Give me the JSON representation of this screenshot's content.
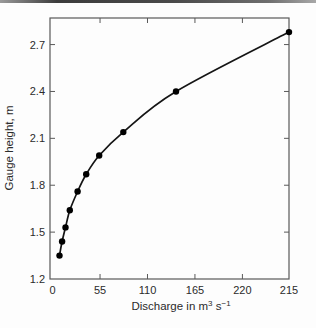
{
  "page": {
    "background": "#fdfdfd",
    "top_rule_color": "#4a4a4a"
  },
  "chart_data": {
    "type": "line",
    "title": "",
    "ylabel": "Gauge height, m",
    "xlabel_plain": "Discharge in m3 s−1",
    "xlabel_parts": [
      {
        "t": "Discharge in m",
        "sup": false
      },
      {
        "t": "3",
        "sup": true
      },
      {
        "t": " s",
        "sup": false
      },
      {
        "t": "−1",
        "sup": true
      }
    ],
    "xlim": [
      -3,
      274
    ],
    "ylim": [
      1.2,
      2.87
    ],
    "grid": false,
    "legend": null,
    "x_ticks": {
      "values": [
        0,
        55,
        110,
        165,
        220,
        274
      ],
      "labels": [
        "0",
        "55",
        "110",
        "165",
        "220",
        "215"
      ]
    },
    "y_ticks": {
      "values": [
        1.2,
        1.5,
        1.8,
        2.1,
        2.4,
        2.7
      ],
      "labels": [
        "1.2",
        "1.5",
        "1.8",
        "2.1",
        "2.4",
        "2.7"
      ]
    },
    "series": [
      {
        "name": "stage-discharge rating curve",
        "marker": "circle",
        "x": [
          8,
          11,
          15,
          20,
          29,
          39,
          54,
          82,
          143,
          274
        ],
        "y": [
          1.35,
          1.44,
          1.53,
          1.64,
          1.76,
          1.87,
          1.99,
          2.14,
          2.4,
          2.78
        ]
      }
    ],
    "colors": {
      "line": "#151515",
      "marker": "#000000",
      "axis": "#595959",
      "text": "#2b2b2b"
    }
  }
}
